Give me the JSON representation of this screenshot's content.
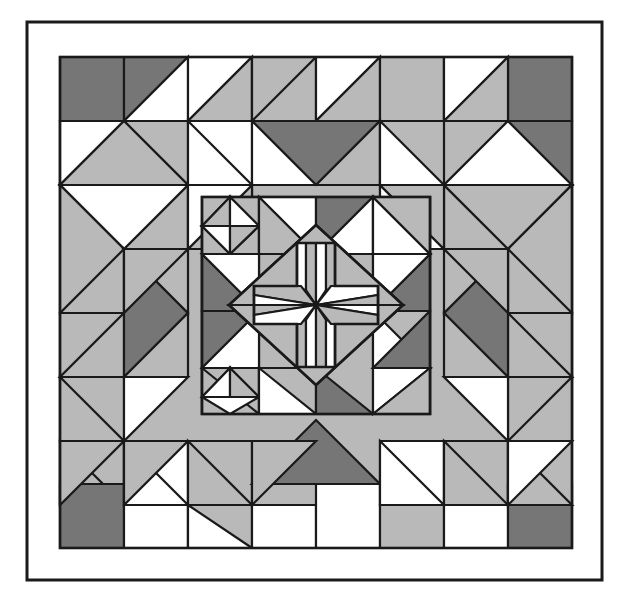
{
  "artwork": {
    "title": "Geometric Patchwork Quilt Block",
    "kind": "quilt-pattern-illustration",
    "canvas": {
      "width": 628,
      "height": 607
    },
    "background_color": "#ffffff"
  },
  "palette": {
    "white": "#ffffff",
    "light_gray": "#b9b9b9",
    "mid_gray": "#a8a8a8",
    "dark_gray": "#767676",
    "outline": "#1a1a1a",
    "paper": "#ffffff"
  },
  "frame": {
    "outer_border": {
      "x": 27,
      "y": 22,
      "width": 575,
      "height": 558,
      "stroke": "#1a1a1a",
      "stroke_width": 3,
      "fill": "none"
    },
    "mat_color": "#ffffff"
  },
  "quilt_block": {
    "x": 60,
    "y": 57,
    "width": 512,
    "height": 491,
    "grid_columns": 8,
    "grid_rows": 8,
    "symmetry": "4-fold rotational",
    "rings": [
      {
        "name": "outer-ring",
        "label": "Outer pieced border ring"
      },
      {
        "name": "middle-ring",
        "label": "Middle diagonal ring"
      },
      {
        "name": "inner-ring",
        "label": "Inner framed square"
      },
      {
        "name": "center-medallion",
        "label": "Central pinwheel cross medallion"
      }
    ]
  },
  "inner_block": {
    "x": 202,
    "y": 197,
    "width": 228,
    "height": 217,
    "stroke": "#1a1a1a",
    "fill": "#b9b9b9"
  },
  "center_medallion": {
    "cx": 316,
    "cy": 305,
    "radius": 62,
    "motif": "pinwheel-cross",
    "arm_count": 4
  }
}
